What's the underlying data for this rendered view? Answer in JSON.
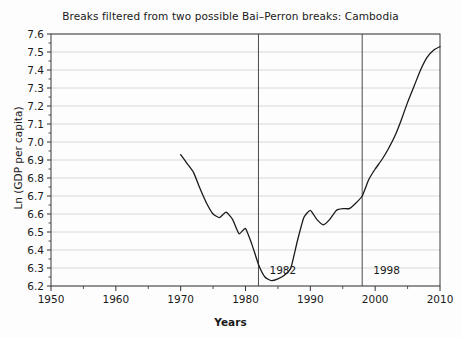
{
  "chart_data": {
    "type": "line",
    "title": "Breaks filtered from two possible Bai–Perron breaks: Cambodia",
    "xlabel": "Years",
    "ylabel": "Ln (GDP per capita)",
    "xlim": [
      1950,
      2010
    ],
    "ylim": [
      6.2,
      7.6
    ],
    "xticks": [
      1950,
      1960,
      1970,
      1980,
      1990,
      2000,
      2010
    ],
    "xtick_labels": [
      "1950",
      "1960",
      "1970",
      "1980",
      "1990",
      "2000",
      "2010"
    ],
    "yticks": [
      6.2,
      6.3,
      6.4,
      6.5,
      6.6,
      6.7,
      6.8,
      6.9,
      7.0,
      7.1,
      7.2,
      7.3,
      7.4,
      7.5,
      7.6
    ],
    "ytick_labels": [
      "6.2",
      "6.3",
      "6.4",
      "6.5",
      "6.6",
      "6.7",
      "6.8",
      "6.9",
      "7.0",
      "7.1",
      "7.2",
      "7.3",
      "7.4",
      "7.5",
      "7.6"
    ],
    "grid": "horizontal",
    "grid_color": "#d8d8d8",
    "line_color": "#1a1a1a",
    "series": [
      {
        "name": "Ln (GDP per capita)",
        "x": [
          1970,
          1971,
          1972,
          1973,
          1974,
          1975,
          1976,
          1977,
          1978,
          1979,
          1980,
          1981,
          1982,
          1983,
          1984,
          1985,
          1986,
          1987,
          1988,
          1989,
          1990,
          1991,
          1992,
          1993,
          1994,
          1995,
          1996,
          1997,
          1998,
          1999,
          2000,
          2001,
          2002,
          2003,
          2004,
          2005,
          2006,
          2007,
          2008,
          2009,
          2010
        ],
        "values": [
          6.93,
          6.88,
          6.83,
          6.74,
          6.66,
          6.6,
          6.58,
          6.61,
          6.57,
          6.49,
          6.52,
          6.43,
          6.32,
          6.25,
          6.23,
          6.24,
          6.26,
          6.3,
          6.45,
          6.58,
          6.62,
          6.57,
          6.54,
          6.57,
          6.62,
          6.63,
          6.63,
          6.66,
          6.7,
          6.79,
          6.85,
          6.9,
          6.96,
          7.03,
          7.12,
          7.22,
          7.31,
          7.4,
          7.47,
          7.51,
          7.53
        ]
      }
    ],
    "vertical_breaks": [
      {
        "year": 1982,
        "label": "1982",
        "label_x": 1983.7,
        "label_y": 6.265,
        "color": "#4a4a4a"
      },
      {
        "year": 1998,
        "label": "1998",
        "label_x": 1999.7,
        "label_y": 6.265,
        "color": "#4a4a4a"
      }
    ]
  }
}
